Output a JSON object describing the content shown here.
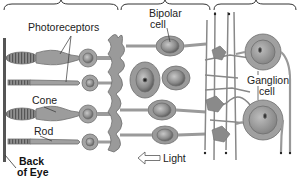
{
  "diagram": {
    "type": "retina-cell-layers",
    "colors": {
      "cell_fill": "#9a9a9a",
      "cell_outline": "#6e6e6e",
      "nucleus": "#7a7a7a",
      "nucleus_dot": "#2a2a2a",
      "back_of_eye": "#555555",
      "background": "#ffffff"
    },
    "braces": [
      {
        "id": "photoreceptor-layer",
        "x_start": 4,
        "x_end": 118
      },
      {
        "id": "bipolar-layer",
        "x_start": 121,
        "x_end": 210
      },
      {
        "id": "ganglion-layer",
        "x_start": 214,
        "x_end": 296
      }
    ],
    "labels": {
      "photoreceptors": "Photoreceptors",
      "cone": "Cone",
      "rod": "Rod",
      "back_of_eye_line1": "Back",
      "back_of_eye_line2": "of Eye",
      "bipolar_line1": "Bipolar",
      "bipolar_line2": "cell",
      "ganglion_line1": "Ganglion",
      "ganglion_line2": "cell",
      "light": "Light"
    },
    "arrow": {
      "direction": "left",
      "label": "Light"
    }
  }
}
